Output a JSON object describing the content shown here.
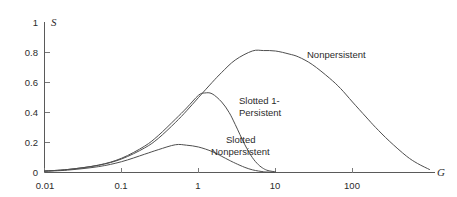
{
  "chart_data": {
    "type": "line",
    "title": "",
    "subtitle": "",
    "xlabel": "G",
    "ylabel": "S",
    "xscale": "log",
    "xlim": [
      0.01,
      1000
    ],
    "ylim": [
      0,
      1
    ],
    "grid": false,
    "legend_position": "inline-annotations",
    "x_ticks": [
      {
        "value": 0.01,
        "label": "0.01"
      },
      {
        "value": 0.1,
        "label": "0.1"
      },
      {
        "value": 1,
        "label": "1"
      },
      {
        "value": 10,
        "label": "10"
      },
      {
        "value": 100,
        "label": "100"
      }
    ],
    "y_ticks": [
      {
        "value": 0,
        "label": "0"
      },
      {
        "value": 0.2,
        "label": "0.2"
      },
      {
        "value": 0.4,
        "label": "0.4"
      },
      {
        "value": 0.6,
        "label": "0.6"
      },
      {
        "value": 0.8,
        "label": "0.8"
      },
      {
        "value": 1,
        "label": "1"
      }
    ],
    "series": [
      {
        "name": "Nonpersistent",
        "label": "Nonpersistent",
        "peak": {
          "x": 10,
          "y": 0.81
        },
        "x": [
          0.01,
          0.02,
          0.05,
          0.1,
          0.2,
          0.3,
          0.5,
          0.7,
          1,
          1.5,
          2,
          3,
          5,
          7,
          10,
          15,
          20,
          30,
          50,
          70,
          100,
          150,
          200,
          300,
          500,
          700,
          1000
        ],
        "y": [
          0.01,
          0.02,
          0.048,
          0.09,
          0.164,
          0.227,
          0.333,
          0.411,
          0.5,
          0.6,
          0.667,
          0.75,
          0.81,
          0.813,
          0.81,
          0.79,
          0.77,
          0.72,
          0.63,
          0.56,
          0.47,
          0.37,
          0.3,
          0.21,
          0.11,
          0.06,
          0.02
        ]
      },
      {
        "name": "Slotted 1-Persistent",
        "label": "Slotted 1-\nPersistent",
        "label_line1": "Slotted 1-",
        "label_line2": "Persistent",
        "peak": {
          "x": 1.1,
          "y": 0.53
        },
        "x": [
          0.01,
          0.02,
          0.05,
          0.1,
          0.2,
          0.3,
          0.5,
          0.7,
          1,
          1.2,
          1.5,
          2,
          2.5,
          3,
          4,
          5,
          6,
          7,
          8,
          10
        ],
        "y": [
          0.01,
          0.02,
          0.049,
          0.095,
          0.176,
          0.246,
          0.355,
          0.43,
          0.515,
          0.53,
          0.525,
          0.47,
          0.4,
          0.32,
          0.185,
          0.1,
          0.052,
          0.026,
          0.013,
          0.004
        ]
      },
      {
        "name": "Slotted Nonpersistent",
        "label": "Slotted\nNonpersistent",
        "label_line1": "Slotted",
        "label_line2": "Nonpersistent",
        "peak": {
          "x": 0.5,
          "y": 0.185
        },
        "x": [
          0.01,
          0.02,
          0.05,
          0.1,
          0.2,
          0.3,
          0.5,
          0.7,
          1,
          1.5,
          2,
          2.5,
          3,
          4,
          5,
          6,
          7,
          8,
          10
        ],
        "y": [
          0.008,
          0.016,
          0.039,
          0.072,
          0.122,
          0.152,
          0.185,
          0.182,
          0.17,
          0.14,
          0.108,
          0.082,
          0.062,
          0.034,
          0.018,
          0.01,
          0.005,
          0.003,
          0.001
        ]
      }
    ]
  },
  "axis": {
    "y_title": "S",
    "x_title": "G"
  },
  "annotations": {
    "nonpersistent": "Nonpersistent",
    "slotted_1_persistent_line1": "Slotted 1-",
    "slotted_1_persistent_line2": "Persistent",
    "slotted_nonpersistent_line1": "Slotted",
    "slotted_nonpersistent_line2": "Nonpersistent"
  },
  "colors": {
    "background": "#ffffff",
    "axis": "#5a5a5a",
    "curve": "#4e4e4e",
    "text": "#2b2b2b"
  }
}
